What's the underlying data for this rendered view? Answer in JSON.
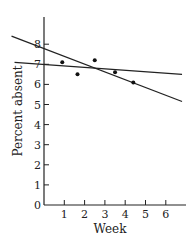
{
  "chart_data": {
    "type": "scatter",
    "title": "",
    "xlabel": "Week",
    "ylabel": "Percent absent",
    "xlim": [
      0,
      7
    ],
    "ylim": [
      0,
      9
    ],
    "x_ticks": [
      1,
      2,
      3,
      4,
      5,
      6
    ],
    "y_ticks": [
      0,
      1,
      2,
      3,
      4,
      5,
      6,
      7,
      8
    ],
    "grid": false,
    "legend": "none",
    "points": [
      {
        "x": 0.9,
        "y": 7.1
      },
      {
        "x": 1.65,
        "y": 6.5
      },
      {
        "x": 2.5,
        "y": 7.2
      },
      {
        "x": 3.5,
        "y": 6.6
      },
      {
        "x": 4.4,
        "y": 6.1
      }
    ],
    "lines": [
      {
        "name": "steep-fit-line",
        "x": [
          -1.6,
          6.8
        ],
        "y": [
          8.4,
          5.15
        ]
      },
      {
        "name": "flat-fit-line",
        "x": [
          -1.45,
          6.8
        ],
        "y": [
          7.1,
          6.5
        ]
      }
    ]
  }
}
